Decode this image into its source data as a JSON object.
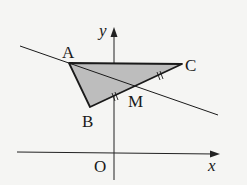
{
  "diagram": {
    "type": "coordinate geometry figure",
    "axes": {
      "x_label": "x",
      "y_label": "y",
      "origin_label": "O"
    },
    "points": {
      "A": {
        "label": "A"
      },
      "B": {
        "label": "B"
      },
      "C": {
        "label": "C"
      },
      "M": {
        "label": "M",
        "note": "midpoint of BC"
      }
    },
    "shapes": [
      {
        "name": "triangle ABC",
        "fill": "#bcbcbc",
        "stroke": "#1a1a1a"
      },
      {
        "name": "line AM",
        "stroke": "#1a1a1a"
      }
    ],
    "tick_marks": "double tick marks on BM and MC indicating equal segments"
  }
}
